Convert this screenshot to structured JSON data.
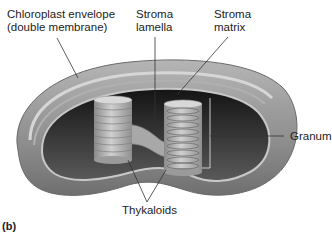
{
  "figure": {
    "panel_label": "(b)",
    "labels": {
      "envelope_line1": "Chloroplast envelope",
      "envelope_line2": "(double membrane)",
      "lamella_line1": "Stroma",
      "lamella_line2": "lamella",
      "matrix_line1": "Stroma",
      "matrix_line2": "matrix",
      "granum": "Granum",
      "thylakoids": "Thykaloids"
    },
    "colors": {
      "outer_envelope": "#9a9a9a",
      "inner_membrane": "#c4c4c4",
      "stroma_dark": "#2a2a2a",
      "grana": "#b8b8b8",
      "leader_lines": "#333333"
    }
  }
}
